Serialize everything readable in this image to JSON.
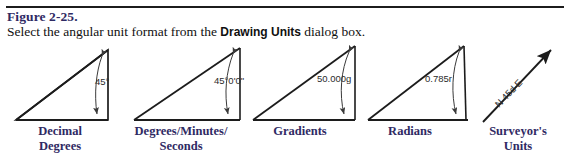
{
  "figure": {
    "number": "Figure 2-25.",
    "caption_before": "Select the angular unit format from the ",
    "caption_bold": "Drawing Units",
    "caption_after": " dialog box."
  },
  "colors": {
    "heading": "#2f2a63",
    "label": "#2f2a63",
    "line": "#1c1c1c",
    "annotation": "#3a3a3a",
    "background": "#ffffff"
  },
  "diagram": {
    "items": [
      {
        "id": "decimal-degrees",
        "angle_value": "45°",
        "label": "Decimal\nDegrees",
        "shape": "triangle"
      },
      {
        "id": "degrees-minutes-seconds",
        "angle_value": "45°0'0\"",
        "label": "Degrees/Minutes/\nSeconds",
        "shape": "triangle"
      },
      {
        "id": "gradients",
        "angle_value": "50.000g",
        "label": "Gradients",
        "shape": "triangle"
      },
      {
        "id": "radians",
        "angle_value": "0.785r",
        "label": "Radians",
        "shape": "triangle"
      },
      {
        "id": "surveyors-units",
        "angle_value": "N 45d E",
        "label": "Surveyor's\nUnits",
        "shape": "arrow"
      }
    ]
  }
}
